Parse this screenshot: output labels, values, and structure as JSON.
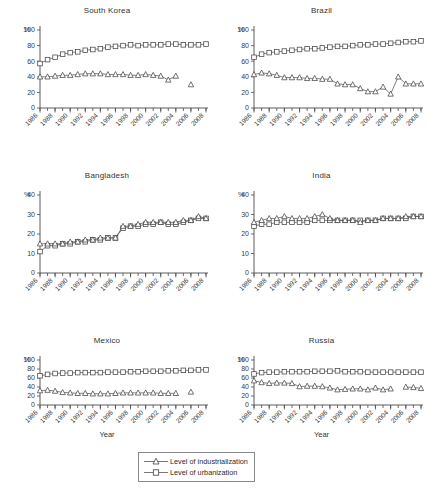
{
  "figure": {
    "xlabel": "Year",
    "ylabel_symbol": "%",
    "legend": {
      "items": [
        {
          "label": "Level of industrialization",
          "marker": "triangle-marker"
        },
        {
          "label": "Level of urbanization",
          "marker": "square-marker"
        }
      ]
    }
  },
  "chart_data": [
    {
      "type": "line",
      "title": "South Korea",
      "xlabel": "Year",
      "ylabel": "%",
      "ylim": [
        0,
        100
      ],
      "yticks": [
        0,
        20,
        40,
        60,
        80,
        100
      ],
      "xlim": [
        1986,
        2008
      ],
      "xticks": [
        1986,
        1988,
        1990,
        1992,
        1994,
        1996,
        1998,
        2000,
        2002,
        2004,
        2006,
        2008
      ],
      "grid": false,
      "legend_position": "below-figure",
      "x": [
        1986,
        1987,
        1988,
        1989,
        1990,
        1991,
        1992,
        1993,
        1994,
        1995,
        1996,
        1997,
        1998,
        1999,
        2000,
        2001,
        2002,
        2003,
        2004,
        2005,
        2006,
        2007,
        2008
      ],
      "series": [
        {
          "name": "Level of urbanization",
          "marker": "square",
          "values": [
            57,
            62,
            65,
            69,
            71,
            72,
            74,
            75,
            76,
            78,
            79,
            80,
            81,
            80,
            81,
            81,
            81,
            82,
            82,
            81,
            81,
            81,
            82
          ]
        },
        {
          "name": "Level of industrialization",
          "marker": "triangle",
          "values": [
            40,
            40,
            41,
            42,
            42,
            43,
            44,
            44,
            44,
            43,
            43,
            43,
            42,
            42,
            43,
            42,
            41,
            36,
            41,
            null,
            30,
            null,
            null
          ]
        }
      ]
    },
    {
      "type": "line",
      "title": "Brazil",
      "xlabel": "Year",
      "ylabel": "%",
      "ylim": [
        0,
        100
      ],
      "yticks": [
        0,
        20,
        40,
        60,
        80,
        100
      ],
      "xlim": [
        1986,
        2008
      ],
      "xticks": [
        1986,
        1988,
        1990,
        1992,
        1994,
        1996,
        1998,
        2000,
        2002,
        2004,
        2006,
        2008
      ],
      "grid": false,
      "legend_position": "below-figure",
      "x": [
        1986,
        1987,
        1988,
        1989,
        1990,
        1991,
        1992,
        1993,
        1994,
        1995,
        1996,
        1997,
        1998,
        1999,
        2000,
        2001,
        2002,
        2003,
        2004,
        2005,
        2006,
        2007,
        2008
      ],
      "series": [
        {
          "name": "Level of urbanization",
          "marker": "square",
          "values": [
            65,
            69,
            71,
            72,
            73,
            74,
            75,
            76,
            76,
            77,
            78,
            79,
            79,
            80,
            81,
            81,
            82,
            82,
            83,
            84,
            85,
            85,
            86
          ]
        },
        {
          "name": "Level of industrialization",
          "marker": "triangle",
          "values": [
            43,
            45,
            44,
            42,
            39,
            39,
            39,
            38,
            38,
            37,
            37,
            31,
            30,
            30,
            25,
            21,
            21,
            27,
            18,
            40,
            31,
            31,
            31
          ]
        }
      ]
    },
    {
      "type": "line",
      "title": "Bangladesh",
      "xlabel": "Year",
      "ylabel": "%",
      "ylim": [
        0,
        40
      ],
      "yticks": [
        0,
        10,
        20,
        30,
        40
      ],
      "xlim": [
        1986,
        2008
      ],
      "xticks": [
        1986,
        1988,
        1990,
        1992,
        1994,
        1996,
        1998,
        2000,
        2002,
        2004,
        2006,
        2008
      ],
      "grid": false,
      "legend_position": "below-figure",
      "x": [
        1986,
        1987,
        1988,
        1989,
        1990,
        1991,
        1992,
        1993,
        1994,
        1995,
        1996,
        1997,
        1998,
        1999,
        2000,
        2001,
        2002,
        2003,
        2004,
        2005,
        2006,
        2007,
        2008
      ],
      "series": [
        {
          "name": "Level of urbanization",
          "marker": "square",
          "values": [
            11,
            14,
            14,
            15,
            15,
            16,
            16,
            17,
            17,
            18,
            18,
            23,
            24,
            24,
            25,
            25,
            26,
            25,
            25,
            26,
            27,
            28,
            28
          ]
        },
        {
          "name": "Level of industrialization",
          "marker": "triangle",
          "values": [
            15,
            15,
            15,
            15,
            16,
            16,
            17,
            17,
            18,
            18,
            18,
            24,
            24,
            25,
            26,
            26,
            26,
            26,
            26,
            27,
            27,
            29,
            28
          ]
        }
      ]
    },
    {
      "type": "line",
      "title": "India",
      "xlabel": "Year",
      "ylabel": "%",
      "ylim": [
        0,
        40
      ],
      "yticks": [
        0,
        10,
        20,
        30,
        40
      ],
      "xlim": [
        1986,
        2008
      ],
      "xticks": [
        1986,
        1988,
        1990,
        1992,
        1994,
        1996,
        1998,
        2000,
        2002,
        2004,
        2006,
        2008
      ],
      "grid": false,
      "legend_position": "below-figure",
      "x": [
        1986,
        1987,
        1988,
        1989,
        1990,
        1991,
        1992,
        1993,
        1994,
        1995,
        1996,
        1997,
        1998,
        1999,
        2000,
        2001,
        2002,
        2003,
        2004,
        2005,
        2006,
        2007,
        2008
      ],
      "series": [
        {
          "name": "Level of urbanization",
          "marker": "square",
          "values": [
            24,
            25,
            25,
            26,
            26,
            26,
            26,
            26,
            27,
            27,
            27,
            27,
            27,
            27,
            27,
            27,
            27,
            28,
            28,
            28,
            28,
            29,
            29
          ]
        },
        {
          "name": "Level of industrialization",
          "marker": "triangle",
          "values": [
            26,
            27,
            28,
            28,
            29,
            28,
            28,
            28,
            29,
            30,
            28,
            27,
            27,
            27,
            26,
            27,
            27,
            28,
            28,
            28,
            29,
            29,
            29
          ]
        }
      ]
    },
    {
      "type": "line",
      "title": "Mexico",
      "xlabel": "Year",
      "ylabel": "%",
      "ylim": [
        0,
        100
      ],
      "yticks": [
        0,
        20,
        40,
        60,
        80,
        100
      ],
      "xlim": [
        1986,
        2008
      ],
      "xticks": [
        1986,
        1988,
        1990,
        1992,
        1994,
        1996,
        1998,
        2000,
        2002,
        2004,
        2006,
        2008
      ],
      "grid": false,
      "legend_position": "below-figure",
      "x": [
        1986,
        1987,
        1988,
        1989,
        1990,
        1991,
        1992,
        1993,
        1994,
        1995,
        1996,
        1997,
        1998,
        1999,
        2000,
        2001,
        2002,
        2003,
        2004,
        2005,
        2006,
        2007,
        2008
      ],
      "series": [
        {
          "name": "Level of urbanization",
          "marker": "square",
          "values": [
            65,
            68,
            70,
            71,
            71,
            72,
            72,
            72,
            72,
            73,
            73,
            73,
            74,
            74,
            75,
            75,
            75,
            76,
            76,
            77,
            77,
            78,
            78
          ]
        },
        {
          "name": "Level of industrialization",
          "marker": "triangle",
          "values": [
            32,
            33,
            31,
            28,
            27,
            26,
            26,
            25,
            25,
            25,
            26,
            27,
            27,
            27,
            27,
            27,
            26,
            26,
            26,
            null,
            29,
            null,
            null
          ]
        }
      ]
    },
    {
      "type": "line",
      "title": "Russia",
      "xlabel": "Year",
      "ylabel": "%",
      "ylim": [
        0,
        100
      ],
      "yticks": [
        0,
        20,
        40,
        60,
        80,
        100
      ],
      "xlim": [
        1986,
        2008
      ],
      "xticks": [
        1986,
        1988,
        1990,
        1992,
        1994,
        1996,
        1998,
        2000,
        2002,
        2004,
        2006,
        2008
      ],
      "grid": false,
      "legend_position": "below-figure",
      "x": [
        1986,
        1987,
        1988,
        1989,
        1990,
        1991,
        1992,
        1993,
        1994,
        1995,
        1996,
        1997,
        1998,
        1999,
        2000,
        2001,
        2002,
        2003,
        2004,
        2005,
        2006,
        2007,
        2008
      ],
      "series": [
        {
          "name": "Level of urbanization",
          "marker": "square",
          "values": [
            69,
            72,
            73,
            73,
            74,
            74,
            74,
            74,
            75,
            75,
            75,
            76,
            74,
            74,
            74,
            73,
            73,
            73,
            73,
            73,
            73,
            73,
            73
          ]
        },
        {
          "name": "Level of industrialization",
          "marker": "triangle",
          "values": [
            54,
            50,
            48,
            49,
            49,
            48,
            41,
            42,
            42,
            41,
            38,
            34,
            35,
            36,
            36,
            34,
            38,
            34,
            36,
            null,
            40,
            39,
            37
          ]
        }
      ]
    }
  ]
}
